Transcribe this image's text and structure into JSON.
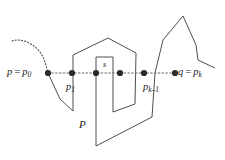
{
  "figure": {
    "kind": "geometry-diagram",
    "colors": {
      "polygon_stroke": "#3b3b3b",
      "segment_stroke": "#666666",
      "curve_stroke": "#555555",
      "vertex_fill": "#2a2a2a",
      "background": "#ffffff"
    },
    "labels": [
      {
        "name": "label-p-equals-p0",
        "text": "p = p₀",
        "base": "p",
        "relation": "=",
        "point": "p",
        "index": "0"
      },
      {
        "name": "label-p1",
        "text": "p₁",
        "base": "p",
        "relation": "",
        "point": "p",
        "index": "1"
      },
      {
        "name": "label-s",
        "text": "s",
        "base": "s",
        "relation": "",
        "point": "s",
        "index": ""
      },
      {
        "name": "label-pk-minus-1",
        "text": "pₖ₋₁",
        "base": "p",
        "relation": "",
        "point": "p",
        "index": "k-1"
      },
      {
        "name": "label-q-equals-pk",
        "text": "q = pₖ",
        "base": "q",
        "relation": "=",
        "point": "p",
        "index": "k"
      },
      {
        "name": "label-P-polygon",
        "text": "P",
        "base": "P",
        "relation": "",
        "point": "P",
        "index": ""
      }
    ],
    "label_text": {
      "p0_lead": "p",
      "p0_eq": "=",
      "p0_sym": "p",
      "p0_sub": "0",
      "p1_sym": "p",
      "p1_sub": "1",
      "s_sym": "s",
      "pk1_sym": "p",
      "pk1_sub": "k–1",
      "q_lead": "q",
      "q_eq": "=",
      "q_sym": "p",
      "q_sub": "k",
      "P_sym": "P"
    },
    "vertices": [
      {
        "name": "vertex-p0",
        "x": 48,
        "y": 73
      },
      {
        "name": "vertex-p1",
        "x": 72,
        "y": 73
      },
      {
        "name": "vertex-a",
        "x": 96,
        "y": 73
      },
      {
        "name": "vertex-s",
        "x": 120,
        "y": 73
      },
      {
        "name": "vertex-pk-1",
        "x": 144,
        "y": 73
      },
      {
        "name": "vertex-pk",
        "x": 175,
        "y": 73
      }
    ],
    "segment": {
      "name": "segment-pq",
      "x1": 48,
      "y1": 73,
      "x2": 175,
      "y2": 73
    },
    "dotted_curve": "M 12,41 C 20,38 32,42 40,52 C 44,57 46,65 48,73",
    "polygon_path": "M 48,73 L 60,99 L 73,111 L 73,73 L 72,55 L 108,38 L 136,53 L 135,73 L 134,104 L 113,112 L 113,73 L 113,58 L 96,57 L 96,73 L 96,146 L 152,117 L 155,73 L 163,40 L 183,16 L 196,45 L 198,60 L 215,68",
    "subpaths": [
      {
        "name": "boundary-left-approach",
        "d": "M 48,73 L 60,99 L 73,111"
      },
      {
        "name": "boundary-outer-left-wall",
        "d": "M 73,111 L 73,55 L 108,38 L 136,53 L 135,104"
      },
      {
        "name": "boundary-inner-notch",
        "d": "M 135,104 L 113,112 L 113,57 L 96,57 L 96,146"
      },
      {
        "name": "boundary-bottom-right",
        "d": "M 96,146 L 152,117 L 155,73 L 163,40 L 183,16 L 196,45 L 198,60 L 215,68"
      }
    ]
  }
}
